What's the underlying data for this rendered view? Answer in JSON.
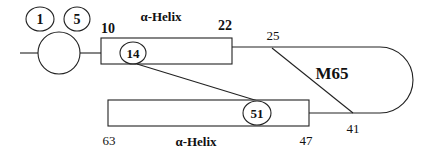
{
  "diagram": {
    "type": "protein secondary structure topology",
    "helix_top": {
      "label": "α-Helix",
      "start_residue": "10",
      "end_residue": "22",
      "marked_residue": "14"
    },
    "helix_bottom": {
      "label": "α-Helix",
      "start_residue": "63",
      "end_residue": "47",
      "marked_residue": "51"
    },
    "loop": {
      "start_residue": "25",
      "end_residue": "41"
    },
    "n_terminal_residues": [
      "1",
      "5"
    ],
    "crosslink_label": "M65"
  }
}
